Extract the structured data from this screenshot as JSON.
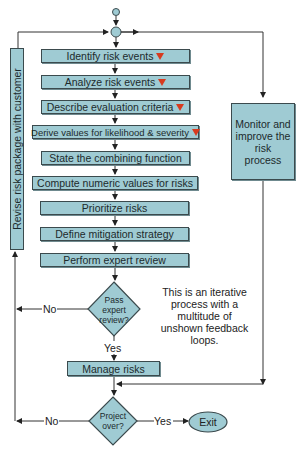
{
  "diagram": {
    "type": "flowchart",
    "steps": [
      {
        "label": "Identify risk events",
        "has_marker": true
      },
      {
        "label": "Analyze risk events",
        "has_marker": true
      },
      {
        "label": "Describe evaluation criteria",
        "has_marker": true
      },
      {
        "label": "Derive values for likelihood & severity",
        "has_marker": true
      },
      {
        "label": "State the combining function",
        "has_marker": false
      },
      {
        "label": "Compute numeric values for risks",
        "has_marker": false
      },
      {
        "label": "Prioritize risks",
        "has_marker": false
      },
      {
        "label": "Define mitigation strategy",
        "has_marker": false
      },
      {
        "label": "Perform expert review",
        "has_marker": false
      }
    ],
    "decision_review": {
      "line1": "Pass",
      "line2": "expert",
      "line3": "review?",
      "no_label": "No",
      "yes_label": "Yes"
    },
    "manage": {
      "label": "Manage risks"
    },
    "decision_project": {
      "line1": "Project",
      "line2": "over?",
      "no_label": "No",
      "yes_label": "Yes"
    },
    "exit": {
      "label": "Exit"
    },
    "revise": {
      "label": "Revise risk package with customer"
    },
    "monitor": {
      "line1": "Monitor and",
      "line2": "improve the",
      "line3": "risk",
      "line4": "process"
    },
    "note": {
      "line1": "This is an iterative",
      "line2": "process with a",
      "line3": "multitude of",
      "line4": "unshown feedback",
      "line5": "loops."
    },
    "colors": {
      "fill": "#9fcbd3",
      "stroke": "#3b4a4d",
      "marker": "#d83a1e",
      "line": "#333333"
    }
  }
}
